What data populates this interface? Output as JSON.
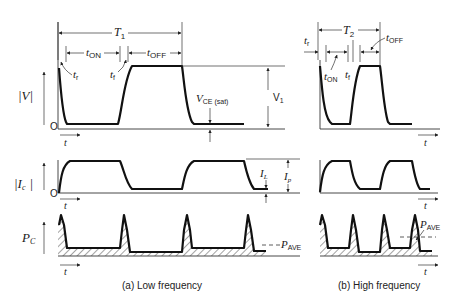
{
  "figure": {
    "panels": [
      {
        "id": "a",
        "caption": "(a) Low frequency",
        "period_label": "T",
        "period_sub": "1",
        "t_on_label": "t",
        "t_on_sub": "ON",
        "t_off_label": "t",
        "t_off_sub": "OFF",
        "t_r_label": "t",
        "t_r_sub": "r",
        "t_f_label": "t",
        "t_f_sub": "f",
        "vce_label": "V",
        "vce_sub": "CE (sat)",
        "v1_label": "V",
        "v1_sub": "1",
        "il_label": "I",
        "il_sub": "L",
        "ip_label": "I",
        "ip_sub": "p",
        "pave_label": "P",
        "pave_sub": "AVE"
      },
      {
        "id": "b",
        "caption": "(b) High frequency",
        "period_label": "T",
        "period_sub": "2",
        "t_on_label": "t",
        "t_on_sub": "ON",
        "t_off_label": "t",
        "t_off_sub": "OFF",
        "t_r_label": "t",
        "t_r_sub": "r",
        "t_f_label": "t",
        "t_f_sub": "f",
        "pave_label": "P",
        "pave_sub": "AVE"
      }
    ],
    "rows": {
      "voltage": {
        "ylabel": "|V|",
        "zero": "O",
        "time": "t"
      },
      "current": {
        "ylabel": "|I",
        "ylabel_sub": "c",
        "ylabel_end": "|",
        "zero": "O",
        "time": "t"
      },
      "power": {
        "ylabel": "P",
        "ylabel_sub": "C",
        "time": "t"
      }
    }
  }
}
